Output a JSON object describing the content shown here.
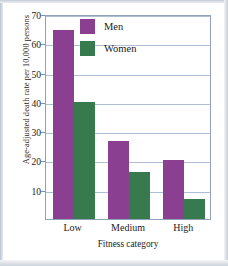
{
  "chart_data": {
    "type": "bar",
    "title": "",
    "subtitle": "",
    "xlabel": "Fitness category",
    "ylabel": "Age-adjusted death rate per 10,000 persons",
    "categories": [
      "Low",
      "Medium",
      "High"
    ],
    "series": [
      {
        "name": "Men",
        "color": "#8a3f91",
        "values": [
          64.5,
          26.5,
          20.0
        ]
      },
      {
        "name": "Women",
        "color": "#377a4e",
        "values": [
          40.0,
          16.0,
          7.0
        ]
      }
    ],
    "ylim": [
      0,
      70
    ],
    "yticks": [
      70,
      60,
      50,
      40,
      30,
      20,
      10
    ],
    "ytick_labels": [
      "70",
      "60",
      "50",
      "40",
      "30",
      "20",
      "10"
    ],
    "grid": true,
    "grid_color": "#aebfd3",
    "legend_position": "top-center",
    "axis_color": "#8fa2b8",
    "background": "#ffffff"
  },
  "legend": {
    "entries": [
      {
        "label": "Men",
        "color": "#8a3f91"
      },
      {
        "label": "Women",
        "color": "#377a4e"
      }
    ]
  }
}
